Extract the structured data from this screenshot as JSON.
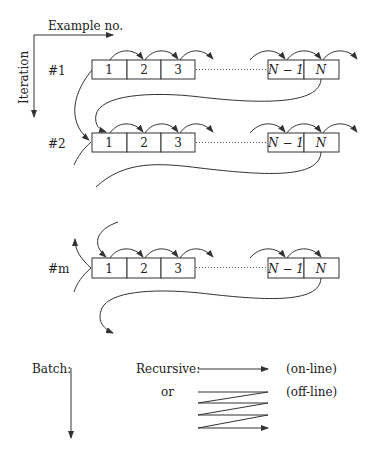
{
  "axes": {
    "x_label": "Example no.",
    "y_label": "Iteration"
  },
  "rows": [
    {
      "label": "#1",
      "cells": [
        "1",
        "2",
        "3"
      ],
      "tail_cells": [
        "N − 1",
        "N"
      ]
    },
    {
      "label": "#2",
      "cells": [
        "1",
        "2",
        "3"
      ],
      "tail_cells": [
        "N − 1",
        "N"
      ]
    },
    {
      "label": "#m",
      "cells": [
        "1",
        "2",
        "3"
      ],
      "tail_cells": [
        "N − 1",
        "N"
      ]
    }
  ],
  "legend": {
    "batch_label": "Batch:",
    "recursive_label": "Recursive:",
    "online_label": "(on-line)",
    "or_label": "or",
    "offline_label": "(off-line)"
  }
}
